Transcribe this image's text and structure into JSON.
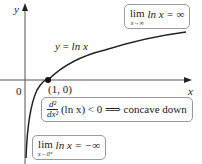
{
  "axes": {
    "x_label": "x",
    "y_label": "y",
    "origin_label": "0"
  },
  "curve": {
    "label_lhs": "y",
    "label_eq": "=",
    "label_rhs": "ln x",
    "function": "ln x",
    "color": "#222222"
  },
  "point": {
    "label": "(1, 0)"
  },
  "annotations": {
    "limit_infinity": {
      "lim": "lim",
      "sub": "x→∞",
      "expr": "ln x = ∞"
    },
    "second_derivative": {
      "num": "d²",
      "den": "dx²",
      "expr": "(ln x) < 0 ⟹ concave down"
    },
    "limit_zero": {
      "lim": "lim",
      "sub": "x→0⁺",
      "expr": "ln x = −∞"
    }
  }
}
